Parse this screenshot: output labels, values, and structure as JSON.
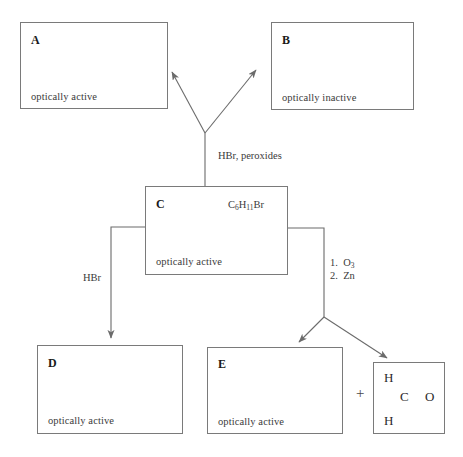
{
  "diagram": {
    "type": "reaction-scheme",
    "boxes": [
      {
        "id": "A",
        "letter": "A",
        "note": "optically active",
        "formula": ""
      },
      {
        "id": "B",
        "letter": "B",
        "note": "optically inactive",
        "formula": ""
      },
      {
        "id": "C",
        "letter": "C",
        "note": "optically active",
        "formula_text": "C6H11Br",
        "formula_html": "C<sub>6</sub>H<sub>11</sub>Br"
      },
      {
        "id": "D",
        "letter": "D",
        "note": "optically active",
        "formula": ""
      },
      {
        "id": "E",
        "letter": "E",
        "note": "optically active",
        "formula": ""
      }
    ],
    "reagents": {
      "top_branch": "HBr, peroxides",
      "left_branch": "HBr",
      "right_branch_step1_text": "1. O3",
      "right_branch_step1_html": "1.&nbsp; O<sub>3</sub>",
      "right_branch_step2_text": "2. Zn",
      "right_branch_step2_html": "2.&nbsp; Zn"
    },
    "byproduct": {
      "plus": "+",
      "structure_name": "formaldehyde",
      "atoms": {
        "h_top": "H",
        "h_bottom": "H",
        "carbon": "C",
        "oxygen": "O"
      },
      "bond_type": "double"
    },
    "colors": {
      "box_border": "#7a7a7a",
      "line": "#6b6b6b",
      "text": "#333333",
      "letter": "#1a1a1a",
      "background": "#ffffff"
    }
  }
}
